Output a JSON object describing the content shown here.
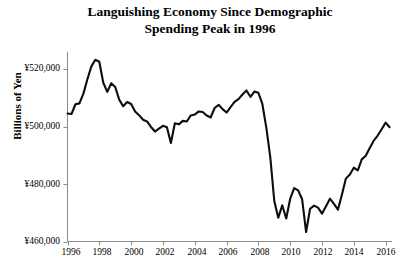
{
  "title": {
    "line1": "Languishing Economy Since Demographic",
    "line2": "Spending Peak in 1996"
  },
  "axes": {
    "y_title": "Billions of Yen",
    "y_tick_labels": [
      "¥520,000",
      "¥500,000",
      "¥480,000",
      "¥460,000"
    ],
    "x_tick_labels": [
      "1996",
      "1998",
      "2000",
      "2002",
      "2004",
      "2006",
      "2008",
      "2010",
      "2012",
      "2014",
      "2016"
    ]
  },
  "colors": {
    "line": "#0d0d0d",
    "axis": "#8c8c8c",
    "text": "#000000",
    "background": "#ffffff"
  },
  "chart_data": {
    "type": "line",
    "title": "Languishing Economy Since Demographic Spending Peak in 1996",
    "xlabel": "",
    "ylabel": "Billions of Yen",
    "xlim": [
      1996.0,
      2016.4
    ],
    "ylim": [
      460000,
      526000
    ],
    "yticks": [
      460000,
      480000,
      500000,
      520000
    ],
    "xticks": [
      1996,
      1998,
      2000,
      2002,
      2004,
      2006,
      2008,
      2010,
      2012,
      2014,
      2016
    ],
    "grid": false,
    "legend": "none",
    "series": [
      {
        "name": "Japan Real GDP",
        "x": [
          1996.0,
          1996.25,
          1996.5,
          1996.75,
          1997.0,
          1997.25,
          1997.5,
          1997.75,
          1998.0,
          1998.25,
          1998.5,
          1998.75,
          1999.0,
          1999.25,
          1999.5,
          1999.75,
          2000.0,
          2000.25,
          2000.5,
          2000.75,
          2001.0,
          2001.25,
          2001.5,
          2001.75,
          2002.0,
          2002.25,
          2002.5,
          2002.75,
          2003.0,
          2003.25,
          2003.5,
          2003.75,
          2004.0,
          2004.25,
          2004.5,
          2004.75,
          2005.0,
          2005.25,
          2005.5,
          2005.75,
          2006.0,
          2006.25,
          2006.5,
          2006.75,
          2007.0,
          2007.25,
          2007.5,
          2007.75,
          2008.0,
          2008.25,
          2008.5,
          2008.75,
          2009.0,
          2009.25,
          2009.5,
          2009.75,
          2010.0,
          2010.25,
          2010.5,
          2010.75,
          2011.0,
          2011.25,
          2011.5,
          2011.75,
          2012.0,
          2012.25,
          2012.5,
          2012.75,
          2013.0,
          2013.25,
          2013.5,
          2013.75,
          2014.0,
          2014.25,
          2014.5,
          2014.75,
          2015.0,
          2015.25,
          2015.5,
          2015.75,
          2016.0,
          2016.25
        ],
        "y": [
          504600,
          504400,
          507800,
          508100,
          511500,
          516500,
          521000,
          523300,
          522600,
          515300,
          512100,
          515100,
          513800,
          509400,
          507100,
          508600,
          507900,
          505300,
          504000,
          502400,
          501800,
          499900,
          498300,
          499300,
          500300,
          499800,
          494300,
          501200,
          500800,
          502000,
          501800,
          503900,
          504200,
          505300,
          505100,
          503900,
          503200,
          506500,
          507600,
          506100,
          504900,
          506800,
          508600,
          509600,
          511200,
          512600,
          510400,
          512200,
          511800,
          507900,
          499600,
          489300,
          474100,
          468300,
          472600,
          468000,
          474900,
          478600,
          477800,
          474700,
          463300,
          471400,
          472500,
          471800,
          469700,
          472300,
          474900,
          473100,
          471100,
          476300,
          481900,
          483300,
          485700,
          484800,
          488600,
          489900,
          492600,
          495100,
          496900,
          499100,
          501400,
          499800
        ]
      }
    ]
  }
}
